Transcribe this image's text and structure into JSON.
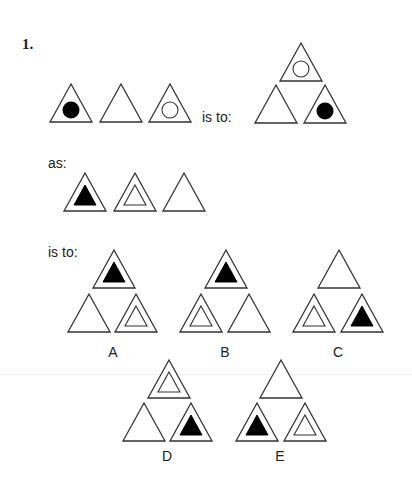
{
  "question": {
    "number": "1.",
    "phrase_is_to_1": "is to:",
    "phrase_as": "as:",
    "phrase_is_to_2": "is to:"
  },
  "options": [
    {
      "label": "A"
    },
    {
      "label": "B"
    },
    {
      "label": "C"
    },
    {
      "label": "D"
    },
    {
      "label": "E"
    }
  ],
  "colors": {
    "stroke": "#333333",
    "fill": "#000000",
    "background": "#ffffff"
  },
  "figures": {
    "row1_sequence": [
      "triangle-black-circle",
      "triangle-empty",
      "triangle-white-circle"
    ],
    "row1_result": {
      "top": "triangle-white-circle",
      "bottom_left": "triangle-empty",
      "bottom_right": "triangle-black-circle"
    },
    "row2_sequence": [
      "triangle-black-triangle",
      "triangle-white-triangle",
      "triangle-empty"
    ],
    "option_A": {
      "top": "triangle-black-triangle",
      "bottom_left": "triangle-empty",
      "bottom_right": "triangle-white-triangle"
    },
    "option_B": {
      "top": "triangle-black-triangle",
      "bottom_left": "triangle-white-triangle",
      "bottom_right": "triangle-empty"
    },
    "option_C": {
      "top": "triangle-empty",
      "bottom_left": "triangle-white-triangle",
      "bottom_right": "triangle-black-triangle"
    },
    "option_D": {
      "top": "triangle-white-triangle",
      "bottom_left": "triangle-empty",
      "bottom_right": "triangle-black-triangle"
    },
    "option_E": {
      "top": "triangle-empty",
      "bottom_left": "triangle-black-triangle",
      "bottom_right": "triangle-white-triangle"
    }
  }
}
